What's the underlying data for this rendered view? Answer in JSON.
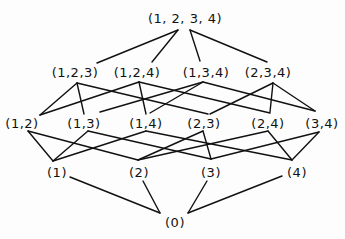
{
  "diagram": {
    "title": "",
    "type": "hasse-diagram",
    "line_color": "#111111",
    "background": "#fdfdfd",
    "nodes": [
      {
        "id": "1234",
        "label": "(1, 2, 3, 4)",
        "x": 185,
        "y": 18
      },
      {
        "id": "123",
        "label": "(1,2,3)",
        "x": 75,
        "y": 72
      },
      {
        "id": "124",
        "label": "(1,2,4)",
        "x": 137,
        "y": 72
      },
      {
        "id": "134",
        "label": "(1,3,4)",
        "x": 206,
        "y": 72
      },
      {
        "id": "234",
        "label": "(2,3,4)",
        "x": 268,
        "y": 72
      },
      {
        "id": "12",
        "label": "(1,2)",
        "x": 22,
        "y": 123
      },
      {
        "id": "13",
        "label": "(1,3)",
        "x": 84,
        "y": 123
      },
      {
        "id": "14",
        "label": "(1,4)",
        "x": 146,
        "y": 123
      },
      {
        "id": "23",
        "label": "(2,3)",
        "x": 204,
        "y": 123
      },
      {
        "id": "24",
        "label": "(2,4)",
        "x": 268,
        "y": 123
      },
      {
        "id": "34",
        "label": "(3,4)",
        "x": 322,
        "y": 123
      },
      {
        "id": "1",
        "label": "(1)",
        "x": 57,
        "y": 172
      },
      {
        "id": "2",
        "label": "(2)",
        "x": 139,
        "y": 172
      },
      {
        "id": "3",
        "label": "(3)",
        "x": 211,
        "y": 172
      },
      {
        "id": "4",
        "label": "(4)",
        "x": 297,
        "y": 172
      },
      {
        "id": "0",
        "label": "(0)",
        "x": 175,
        "y": 222
      }
    ],
    "edges": [
      {
        "from": "1234",
        "to": "123",
        "x1": 178,
        "y1": 30,
        "x2": 97,
        "y2": 63
      },
      {
        "from": "1234",
        "to": "124",
        "x1": 178,
        "y1": 30,
        "x2": 152,
        "y2": 62
      },
      {
        "from": "1234",
        "to": "134",
        "x1": 190,
        "y1": 30,
        "x2": 200,
        "y2": 61
      },
      {
        "from": "1234",
        "to": "234",
        "x1": 190,
        "y1": 30,
        "x2": 267,
        "y2": 62
      },
      {
        "from": "123",
        "to": "12",
        "x1": 77,
        "y1": 83,
        "x2": 40,
        "y2": 115
      },
      {
        "from": "123",
        "to": "13",
        "x1": 77,
        "y1": 83,
        "x2": 84,
        "y2": 114
      },
      {
        "from": "123",
        "to": "23",
        "x1": 77,
        "y1": 83,
        "x2": 208,
        "y2": 114
      },
      {
        "from": "124",
        "to": "12",
        "x1": 139,
        "y1": 82,
        "x2": 40,
        "y2": 115
      },
      {
        "from": "124",
        "to": "14",
        "x1": 139,
        "y1": 82,
        "x2": 146,
        "y2": 114
      },
      {
        "from": "124",
        "to": "24",
        "x1": 139,
        "y1": 82,
        "x2": 270,
        "y2": 113
      },
      {
        "from": "134",
        "to": "13",
        "x1": 203,
        "y1": 82,
        "x2": 100,
        "y2": 112
      },
      {
        "from": "134",
        "to": "14",
        "x1": 203,
        "y1": 82,
        "x2": 150,
        "y2": 113
      },
      {
        "from": "134",
        "to": "34",
        "x1": 203,
        "y1": 82,
        "x2": 315,
        "y2": 111
      },
      {
        "from": "234",
        "to": "23",
        "x1": 273,
        "y1": 83,
        "x2": 210,
        "y2": 114
      },
      {
        "from": "234",
        "to": "24",
        "x1": 273,
        "y1": 83,
        "x2": 270,
        "y2": 112
      },
      {
        "from": "234",
        "to": "34",
        "x1": 273,
        "y1": 83,
        "x2": 315,
        "y2": 111
      },
      {
        "from": "12",
        "to": "1",
        "x1": 28,
        "y1": 131,
        "x2": 53,
        "y2": 161
      },
      {
        "from": "12",
        "to": "2",
        "x1": 28,
        "y1": 131,
        "x2": 138,
        "y2": 160
      },
      {
        "from": "13",
        "to": "1",
        "x1": 88,
        "y1": 131,
        "x2": 53,
        "y2": 161
      },
      {
        "from": "13",
        "to": "3",
        "x1": 88,
        "y1": 131,
        "x2": 211,
        "y2": 159
      },
      {
        "from": "14",
        "to": "1",
        "x1": 146,
        "y1": 131,
        "x2": 53,
        "y2": 161
      },
      {
        "from": "14",
        "to": "4",
        "x1": 146,
        "y1": 131,
        "x2": 292,
        "y2": 160
      },
      {
        "from": "23",
        "to": "2",
        "x1": 203,
        "y1": 131,
        "x2": 138,
        "y2": 160
      },
      {
        "from": "23",
        "to": "3",
        "x1": 203,
        "y1": 131,
        "x2": 211,
        "y2": 159
      },
      {
        "from": "24",
        "to": "2",
        "x1": 268,
        "y1": 131,
        "x2": 138,
        "y2": 160
      },
      {
        "from": "24",
        "to": "4",
        "x1": 268,
        "y1": 131,
        "x2": 292,
        "y2": 160
      },
      {
        "from": "34",
        "to": "3",
        "x1": 319,
        "y1": 132,
        "x2": 211,
        "y2": 159
      },
      {
        "from": "34",
        "to": "4",
        "x1": 319,
        "y1": 132,
        "x2": 292,
        "y2": 160
      },
      {
        "from": "1",
        "to": "0",
        "x1": 70,
        "y1": 177,
        "x2": 160,
        "y2": 213
      },
      {
        "from": "2",
        "to": "0",
        "x1": 143,
        "y1": 181,
        "x2": 160,
        "y2": 213
      },
      {
        "from": "3",
        "to": "0",
        "x1": 207,
        "y1": 181,
        "x2": 188,
        "y2": 213
      },
      {
        "from": "4",
        "to": "0",
        "x1": 282,
        "y1": 176,
        "x2": 188,
        "y2": 213
      }
    ]
  }
}
